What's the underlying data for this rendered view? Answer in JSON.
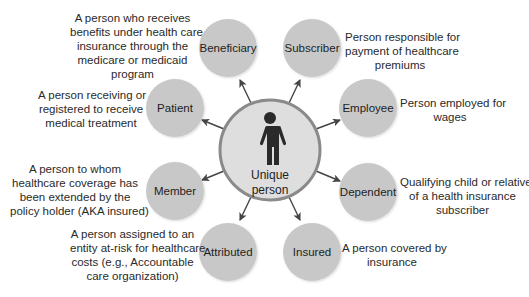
{
  "diagram": {
    "center": {
      "label_line1": "Unique",
      "label_line2": "person",
      "icon": "person-icon"
    },
    "nodes": [
      {
        "label": "Beneficiary",
        "description": [
          "A person who receives",
          "benefits under health care",
          "insurance through the",
          "medicare or medicaid",
          "program"
        ]
      },
      {
        "label": "Subscriber",
        "description": [
          "Person responsible for",
          "payment of healthcare",
          "premiums"
        ]
      },
      {
        "label": "Patient",
        "description": [
          "A person receiving or",
          "registered to receive",
          "medical treatment"
        ]
      },
      {
        "label": "Employee",
        "description": [
          "Person employed for",
          "wages"
        ]
      },
      {
        "label": "Member",
        "description": [
          "A person to whom",
          "healthcare coverage has",
          "been extended by the",
          "policy holder (AKA insured)"
        ]
      },
      {
        "label": "Dependent",
        "description": [
          "Qualifying child or relative",
          "of a health insurance",
          "subscriber"
        ]
      },
      {
        "label": "Attributed",
        "description": [
          "A person assigned to an",
          "entity at-risk for healthcare",
          "costs (e.g., Accountable",
          "care organization)"
        ]
      },
      {
        "label": "Insured",
        "description": [
          "A person covered by",
          "insurance"
        ]
      }
    ],
    "colors": {
      "node_fill": "#c8c8c8",
      "center_fill": "#dedede",
      "center_stroke": "#8a8a8a",
      "arrow": "#444444",
      "text": "#222222"
    }
  }
}
